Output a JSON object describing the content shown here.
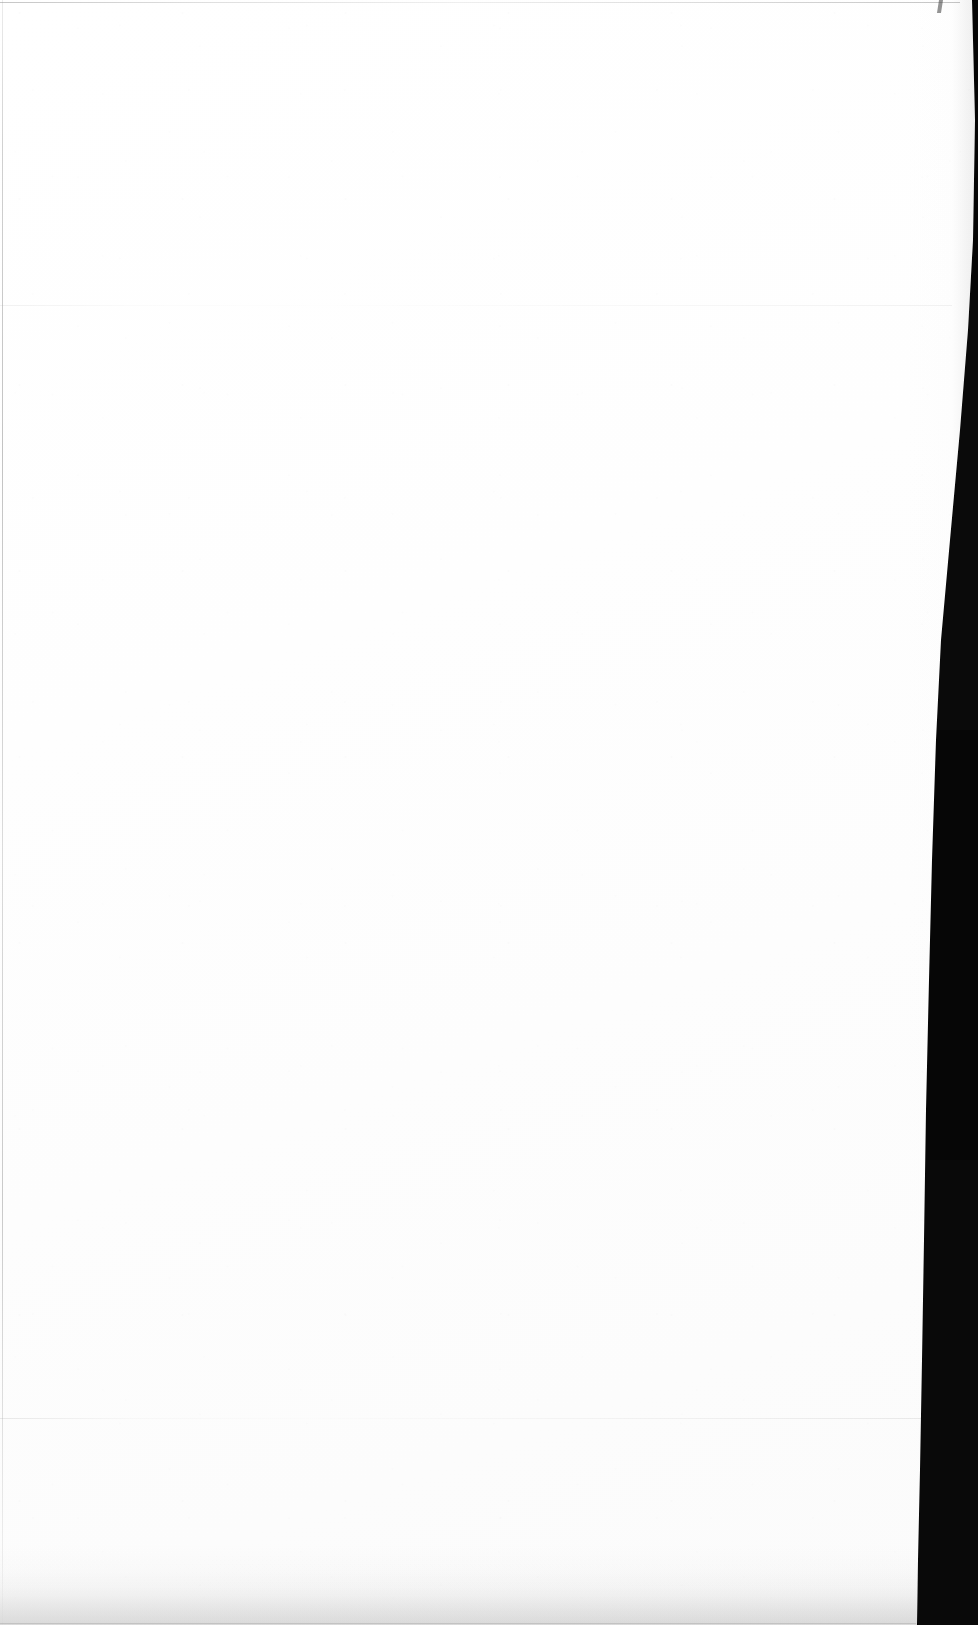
{
  "document": {
    "kind": "scanned-page",
    "page_state": "blank",
    "visible_text": "",
    "text_blocks": [],
    "page_number": "",
    "heading": "",
    "body": ""
  },
  "canvas": {
    "width_px": 978,
    "height_px": 1625
  },
  "colors": {
    "paper": "#fdfdfd",
    "paper_highlight": "#ffffff",
    "scanner_bed": "#000000",
    "edge_line": "#8c8c8c",
    "crease_line": "#b4b4b4",
    "bottom_shadow": "#a8a8a8"
  },
  "regions": {
    "paper_leaf": {
      "label": "scanned paper leaf",
      "left_px": 0,
      "top_px": 0,
      "right_edge_top_px": 972,
      "right_edge_middle_px": 936,
      "right_edge_bottom_px": 917
    },
    "scanner_gutter": {
      "label": "black scanner bed at right",
      "side": "right",
      "max_width_px": 61
    }
  },
  "artifacts": {
    "top_edge_line": {
      "label": "page top edge",
      "y_px": 2
    },
    "left_edge_line": {
      "label": "page left edge",
      "x_px": 2
    },
    "creases": [
      {
        "label": "upper horizontal crease",
        "y_px": 305
      },
      {
        "label": "lower horizontal crease",
        "y_px": 1418
      }
    ],
    "bottom_shading": {
      "label": "bottom shadow band",
      "height_px": 72
    },
    "corner_notch": {
      "label": "top-right corner notch",
      "x_px": 938,
      "y_px": 0
    }
  }
}
